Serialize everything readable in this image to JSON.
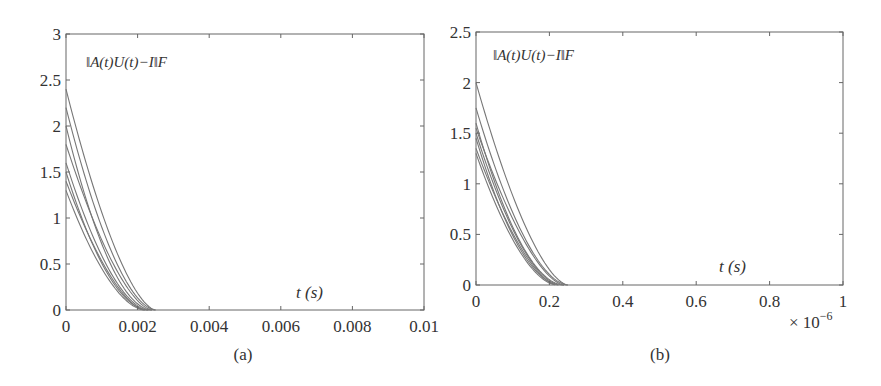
{
  "figure": {
    "panels": [
      {
        "id": "a",
        "caption": "(a)"
      },
      {
        "id": "b",
        "caption": "(b)"
      }
    ]
  },
  "chart_data": [
    {
      "type": "line",
      "panel": "(a)",
      "annotation": "‖A(t)U(t)−I‖F",
      "xlabel": "t (s)",
      "ylabel": "",
      "xlim": [
        0,
        0.01
      ],
      "ylim": [
        0,
        3
      ],
      "x_ticks": [
        0,
        0.002,
        0.004,
        0.006,
        0.008,
        0.01
      ],
      "x_tick_labels": [
        "0",
        "0.002",
        "0.004",
        "0.006",
        "0.008",
        "0.01"
      ],
      "y_ticks": [
        0,
        0.5,
        1,
        1.5,
        2,
        2.5,
        3
      ],
      "y_tick_labels": [
        "0",
        "0.5",
        "1",
        "1.5",
        "2",
        "2.5",
        "3"
      ],
      "grid": false,
      "line_color": "#777777",
      "series": [
        {
          "name": "trajectory 1",
          "y0": 2.4,
          "t_zero": 0.0025
        },
        {
          "name": "trajectory 2",
          "y0": 2.2,
          "t_zero": 0.0025
        },
        {
          "name": "trajectory 3",
          "y0": 2.0,
          "t_zero": 0.0024
        },
        {
          "name": "trajectory 4",
          "y0": 1.8,
          "t_zero": 0.0024
        },
        {
          "name": "trajectory 5",
          "y0": 1.6,
          "t_zero": 0.0023
        },
        {
          "name": "trajectory 6",
          "y0": 1.5,
          "t_zero": 0.0023
        },
        {
          "name": "trajectory 7",
          "y0": 1.4,
          "t_zero": 0.0022
        },
        {
          "name": "trajectory 8",
          "y0": 1.3,
          "t_zero": 0.0022
        }
      ]
    },
    {
      "type": "line",
      "panel": "(b)",
      "annotation": "‖A(t)U(t)−I‖F",
      "xlabel": "t (s)",
      "ylabel": "",
      "x_multiplier": "× 10^-6",
      "xlim": [
        0,
        1
      ],
      "ylim": [
        0,
        2.5
      ],
      "x_ticks": [
        0,
        0.2,
        0.4,
        0.6,
        0.8,
        1
      ],
      "x_tick_labels": [
        "0",
        "0.2",
        "0.4",
        "0.6",
        "0.8",
        "1"
      ],
      "y_ticks": [
        0,
        0.5,
        1,
        1.5,
        2,
        2.5
      ],
      "y_tick_labels": [
        "0",
        "0.5",
        "1",
        "1.5",
        "2",
        "2.5"
      ],
      "grid": false,
      "line_color": "#777777",
      "series": [
        {
          "name": "trajectory 1",
          "y0": 2.0,
          "t_zero": 0.25
        },
        {
          "name": "trajectory 2",
          "y0": 1.75,
          "t_zero": 0.25
        },
        {
          "name": "trajectory 3",
          "y0": 1.6,
          "t_zero": 0.24
        },
        {
          "name": "trajectory 4",
          "y0": 1.55,
          "t_zero": 0.24
        },
        {
          "name": "trajectory 5",
          "y0": 1.5,
          "t_zero": 0.23
        },
        {
          "name": "trajectory 6",
          "y0": 1.45,
          "t_zero": 0.23
        },
        {
          "name": "trajectory 7",
          "y0": 1.35,
          "t_zero": 0.22
        },
        {
          "name": "trajectory 8",
          "y0": 1.3,
          "t_zero": 0.22
        }
      ]
    }
  ]
}
